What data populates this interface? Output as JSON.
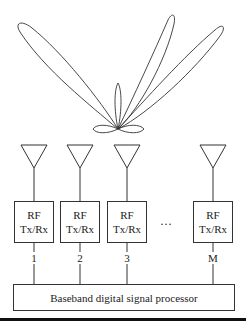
{
  "figure": {
    "beam_pattern": {
      "description": "Polar radiation pattern with three main lobes and small side lobes from a common origin",
      "origin": [
        118,
        129
      ],
      "lobes": [
        {
          "name": "left-main-lobe",
          "tip": [
            17,
            25
          ]
        },
        {
          "name": "center-main-lobe",
          "tip": [
            172,
            15
          ]
        },
        {
          "name": "right-main-lobe",
          "tip": [
            222,
            25
          ]
        },
        {
          "name": "vertical-side-lobe",
          "tip": [
            118,
            83
          ]
        },
        {
          "name": "left-side-lobe",
          "tip": [
            93,
            129
          ]
        },
        {
          "name": "right-side-lobe",
          "tip": [
            144,
            129
          ]
        }
      ]
    },
    "elements": [
      {
        "id": "1",
        "rf_line1": "RF",
        "rf_line2": "Tx/Rx",
        "channel_label": "1"
      },
      {
        "id": "2",
        "rf_line1": "RF",
        "rf_line2": "Tx/Rx",
        "channel_label": "2"
      },
      {
        "id": "3",
        "rf_line1": "RF",
        "rf_line2": "Tx/Rx",
        "channel_label": "3"
      },
      {
        "id": "M",
        "rf_line1": "RF",
        "rf_line2": "Tx/Rx",
        "channel_label": "M"
      }
    ],
    "ellipsis": "…",
    "baseband_label": "Baseband digital signal processor"
  },
  "colors": {
    "stroke": "#333333",
    "background": "#ffffff",
    "rule": "#111111"
  }
}
